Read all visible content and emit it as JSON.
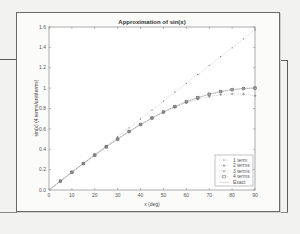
{
  "chart_data": {
    "type": "line",
    "title": "Approximation of sin(x)",
    "xlabel": "x (deg)",
    "ylabel": "sin(x) (4 terms/unit/terms)",
    "xlim": [
      0,
      90
    ],
    "ylim": [
      0,
      1.6
    ],
    "x_ticks": [
      "0",
      "10",
      "20",
      "30",
      "40",
      "50",
      "60",
      "70",
      "80",
      "90"
    ],
    "y_ticks": [
      "0.0",
      "0.2",
      "0.4",
      "0.6",
      "0.8",
      "1",
      "1.2",
      "1.4",
      "1.6"
    ],
    "grid": false,
    "legend_position": "lower right",
    "x": [
      0,
      5,
      10,
      15,
      20,
      25,
      30,
      35,
      40,
      45,
      50,
      55,
      60,
      65,
      70,
      75,
      80,
      85,
      90
    ],
    "series": [
      {
        "name": "1 term",
        "marker": "dot",
        "values": [
          0,
          0.087,
          0.175,
          0.262,
          0.349,
          0.436,
          0.524,
          0.611,
          0.698,
          0.785,
          0.873,
          0.96,
          1.047,
          1.134,
          1.222,
          1.309,
          1.396,
          1.484,
          1.571
        ]
      },
      {
        "name": "2 terms",
        "marker": "plus",
        "values": [
          0,
          0.087,
          0.174,
          0.259,
          0.342,
          0.423,
          0.5,
          0.573,
          0.642,
          0.705,
          0.762,
          0.811,
          0.856,
          0.891,
          0.916,
          0.935,
          0.943,
          0.942,
          0.925
        ]
      },
      {
        "name": "3 terms",
        "marker": "x",
        "values": [
          0,
          0.087,
          0.174,
          0.259,
          0.342,
          0.423,
          0.5,
          0.574,
          0.643,
          0.707,
          0.766,
          0.819,
          0.866,
          0.906,
          0.94,
          0.966,
          0.985,
          0.997,
          1.005
        ]
      },
      {
        "name": "4 terms",
        "marker": "square",
        "values": [
          0,
          0.087,
          0.174,
          0.259,
          0.342,
          0.423,
          0.5,
          0.574,
          0.643,
          0.707,
          0.766,
          0.819,
          0.866,
          0.906,
          0.94,
          0.966,
          0.985,
          0.996,
          1.0
        ]
      },
      {
        "name": "Exact",
        "marker": "circle",
        "values": [
          0,
          0.087,
          0.174,
          0.259,
          0.342,
          0.423,
          0.5,
          0.574,
          0.643,
          0.707,
          0.766,
          0.819,
          0.866,
          0.906,
          0.94,
          0.966,
          0.985,
          0.996,
          1.0
        ]
      }
    ]
  },
  "plot": {
    "title": "Approximation of sin(x)",
    "xlabel": "x (deg)",
    "ylabel": "sin(x) (4 terms/unit/terms)",
    "legend": [
      "1 term",
      "2 terms",
      "3 terms",
      "4 terms",
      "Exact"
    ]
  }
}
